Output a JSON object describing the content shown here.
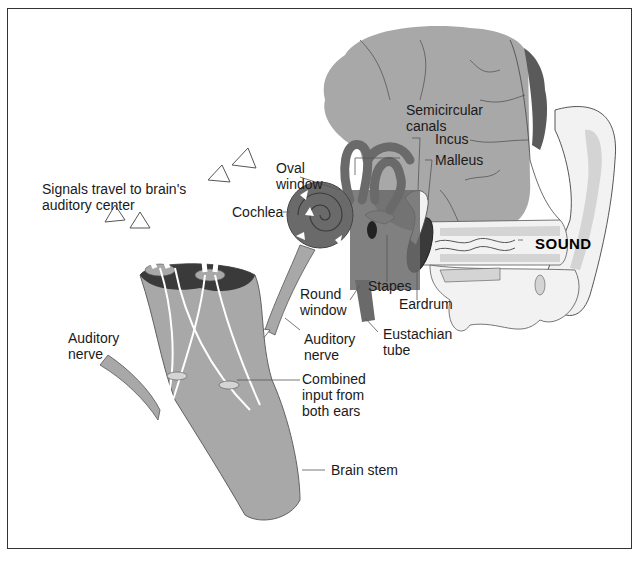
{
  "diagram": {
    "colors": {
      "tissue": "#a8a8a8",
      "tissue_light": "#d4d4d4",
      "ear_fill": "#f2f2f2",
      "cochlea": "#6a6a6a",
      "dark": "#3a3a3a",
      "hair": "#5a5a5a",
      "outline": "#333333"
    },
    "labels": {
      "signals": "Signals travel to brain's\nauditory center",
      "oval_window": "Oval\nwindow",
      "cochlea": "Cochlea",
      "semicircular_canals": "Semicircular\ncanals",
      "incus": "Incus",
      "malleus": "Malleus",
      "sound": "SOUND",
      "stapes": "Stapes",
      "eardrum": "Eardrum",
      "round_window": "Round\nwindow",
      "eustachian_tube": "Eustachian\ntube",
      "auditory_nerve_right": "Auditory\nnerve",
      "auditory_nerve_left": "Auditory\nnerve",
      "combined_input": "Combined\ninput from\nboth ears",
      "brain_stem": "Brain stem"
    }
  }
}
